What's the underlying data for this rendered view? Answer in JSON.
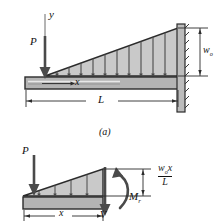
{
  "figure": {
    "caption_a": "(a)",
    "panel_top": {
      "name": "cantilever-beam-with-triangular-load",
      "axis_label_y": "y",
      "point_load_label": "P",
      "distance_label": "x",
      "span_label": "L",
      "peak_load_symbol": "w",
      "peak_load_subscript": "o"
    },
    "panel_bottom": {
      "name": "free-body-diagram-section",
      "point_load_label": "P",
      "distance_label": "x",
      "shear_label": "V",
      "moment_symbol": "M",
      "moment_subscript": "r",
      "load_numerator_symbol": "w",
      "load_numerator_subscript": "o",
      "load_numerator_var": "x",
      "load_denominator": "L"
    }
  },
  "colors": {
    "load_fill": "#c9c9c9",
    "beam_fill": "#b4b4b4",
    "wall_fill": "#bdbdbd",
    "outline": "#2b2b2b",
    "background": "#ffffff"
  }
}
